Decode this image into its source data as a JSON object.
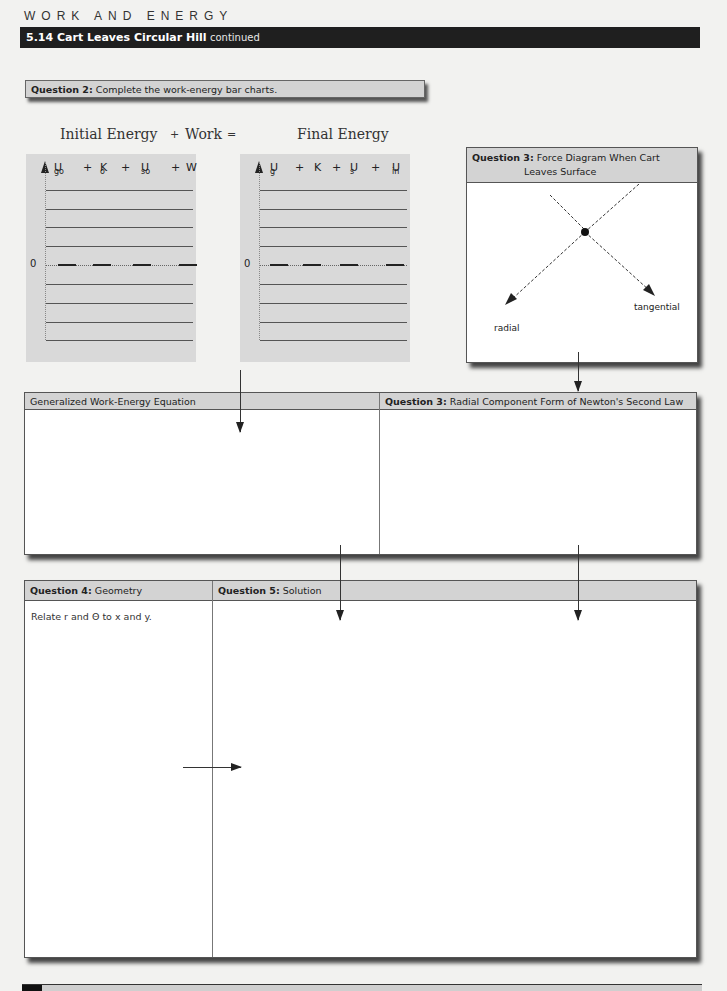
{
  "header": {
    "section": "WORK AND ENERGY",
    "problem_number_title": "5.14 Cart Leaves Circular Hill",
    "continued": "continued"
  },
  "question2": {
    "label": "Question 2:",
    "text": "Complete the work-energy bar charts."
  },
  "equation": {
    "initial": "Initial Energy",
    "plus": "+",
    "work": "Work",
    "equals": "=",
    "final": "Final Energy"
  },
  "chart_initial": {
    "terms": [
      {
        "base": "U",
        "sub": "go"
      },
      {
        "base": "K",
        "sub": "o"
      },
      {
        "base": "U",
        "sub": "so"
      },
      {
        "base": "W",
        "sub": ""
      }
    ],
    "zero_label": "0",
    "plus": "+"
  },
  "chart_final": {
    "terms": [
      {
        "base": "U",
        "sub": "g"
      },
      {
        "base": "K",
        "sub": ""
      },
      {
        "base": "U",
        "sub": "s"
      },
      {
        "base": "U",
        "sub": "in"
      }
    ],
    "zero_label": "0",
    "plus": "+"
  },
  "question3_force": {
    "label": "Question 3:",
    "title_line1": "Force Diagram When Cart",
    "title_line2": "Leaves Surface",
    "radial": "radial",
    "tangential": "tangential"
  },
  "work_energy": {
    "title": "Generalized Work-Energy Equation"
  },
  "question3_radial": {
    "label": "Question 3:",
    "title": "Radial Component Form of Newton's Second Law"
  },
  "question4": {
    "label": "Question 4:",
    "title": "Geometry",
    "note": "Relate r and Θ to x and y."
  },
  "question5": {
    "label": "Question 5:",
    "title": "Solution"
  }
}
